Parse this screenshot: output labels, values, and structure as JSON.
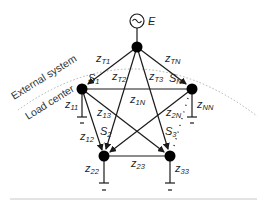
{
  "diagram": {
    "type": "power-system-network",
    "source": {
      "label": "E",
      "symbol": "ac-generator-icon"
    },
    "regions": {
      "outer": "External system",
      "inner": "Load center"
    },
    "nodes": [
      {
        "id": "T",
        "label": ""
      },
      {
        "id": "S1",
        "label": "S",
        "sub": "1"
      },
      {
        "id": "SN",
        "label": "S",
        "sub": "N"
      },
      {
        "id": "S2",
        "label": "S",
        "sub": "2"
      },
      {
        "id": "S3",
        "label": "S",
        "sub": "3"
      }
    ],
    "impedances": [
      {
        "id": "zT1",
        "label": "z",
        "sub": "T1"
      },
      {
        "id": "zTN",
        "label": "z",
        "sub": "TN"
      },
      {
        "id": "zT2",
        "label": "z",
        "sub": "T2"
      },
      {
        "id": "zT3",
        "label": "z",
        "sub": "T3"
      },
      {
        "id": "z1N",
        "label": "z",
        "sub": "1N"
      },
      {
        "id": "z11",
        "label": "z",
        "sub": "11"
      },
      {
        "id": "z13",
        "label": "z",
        "sub": "13"
      },
      {
        "id": "z2N",
        "label": "z",
        "sub": "2N"
      },
      {
        "id": "zNN",
        "label": "z",
        "sub": "NN"
      },
      {
        "id": "z12",
        "label": "z",
        "sub": "12"
      },
      {
        "id": "z22",
        "label": "z",
        "sub": "22"
      },
      {
        "id": "z23",
        "label": "z",
        "sub": "23"
      },
      {
        "id": "z33",
        "label": "z",
        "sub": "33"
      }
    ],
    "colors": {
      "line": "#1a1a1a",
      "node": "#000000",
      "dotted": "#b0b0b0",
      "separator": "#c8c8c8"
    }
  }
}
